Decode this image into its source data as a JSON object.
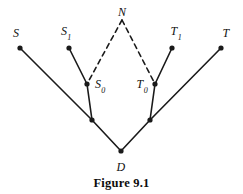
{
  "figure": {
    "caption": "Figure 9.1",
    "background_color": "#ffffff",
    "stroke_color": "#1a1a1a",
    "nodes": [
      {
        "id": "S",
        "label": "S",
        "sub": "",
        "x": 20,
        "y": 48,
        "label_x": 16,
        "label_y": 33,
        "dot": true
      },
      {
        "id": "S1",
        "label": "S",
        "sub": "1",
        "x": 69,
        "y": 48,
        "label_x": 66,
        "label_y": 33,
        "dot": true
      },
      {
        "id": "S0",
        "label": "S",
        "sub": "0",
        "x": 87,
        "y": 84,
        "label_x": 100,
        "label_y": 86,
        "dot": true
      },
      {
        "id": "N",
        "label": "N",
        "sub": "",
        "x": 122,
        "y": 20,
        "label_x": 122,
        "label_y": 12,
        "dot": false
      },
      {
        "id": "T0",
        "label": "T",
        "sub": "0",
        "x": 155,
        "y": 84,
        "label_x": 142,
        "label_y": 86,
        "dot": true
      },
      {
        "id": "T1",
        "label": "T",
        "sub": "1",
        "x": 172,
        "y": 48,
        "label_x": 176,
        "label_y": 33,
        "dot": true
      },
      {
        "id": "T",
        "label": "T",
        "sub": "",
        "x": 221,
        "y": 48,
        "label_x": 226,
        "label_y": 33,
        "dot": true
      },
      {
        "id": "JL",
        "label": "",
        "sub": "",
        "x": 92,
        "y": 120,
        "label_x": 0,
        "label_y": 0,
        "dot": true
      },
      {
        "id": "JR",
        "label": "",
        "sub": "",
        "x": 150,
        "y": 120,
        "label_x": 0,
        "label_y": 0,
        "dot": true
      },
      {
        "id": "D",
        "label": "D",
        "sub": "",
        "x": 121,
        "y": 151,
        "label_x": 121,
        "label_y": 167,
        "dot": true
      }
    ],
    "solid_edges": [
      {
        "from": "S",
        "to": "JL"
      },
      {
        "from": "S1",
        "to": "S0"
      },
      {
        "from": "S0",
        "to": "JL"
      },
      {
        "from": "JL",
        "to": "D"
      },
      {
        "from": "D",
        "to": "JR"
      },
      {
        "from": "JR",
        "to": "T0"
      },
      {
        "from": "T0",
        "to": "T1"
      },
      {
        "from": "JR",
        "to": "T"
      }
    ],
    "dashed_edges": [
      {
        "from": "N",
        "to": "S0"
      },
      {
        "from": "N",
        "to": "T0"
      }
    ],
    "dash_pattern": "5,4",
    "line_width": 1.6,
    "dot_radius": 2.6
  }
}
